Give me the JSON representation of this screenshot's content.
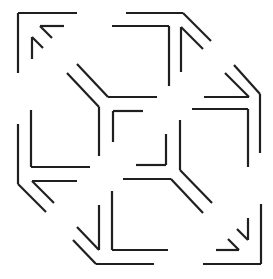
{
  "figure": {
    "title": "",
    "stroke_color": "#1f1f1f",
    "background_color": "#ffffff",
    "segments": [
      {
        "id": "tl-outer-h",
        "x1": 18,
        "y1": 13,
        "x2": 77,
        "y2": 13
      },
      {
        "id": "tl-outer-v",
        "x1": 18,
        "y1": 13,
        "x2": 18,
        "y2": 73
      },
      {
        "id": "tl-arrow-h",
        "x1": 40,
        "y1": 26,
        "x2": 64,
        "y2": 26
      },
      {
        "id": "tl-arrow-d1",
        "x1": 40,
        "y1": 26,
        "x2": 52,
        "y2": 38
      },
      {
        "id": "tl-arrow-v",
        "x1": 32,
        "y1": 37,
        "x2": 32,
        "y2": 59
      },
      {
        "id": "tl-arrow-d2",
        "x1": 32,
        "y1": 37,
        "x2": 43,
        "y2": 48
      },
      {
        "id": "tr-outer-h",
        "x1": 126,
        "y1": 13,
        "x2": 183,
        "y2": 13
      },
      {
        "id": "tr-outer-d",
        "x1": 183,
        "y1": 13,
        "x2": 211,
        "y2": 41
      },
      {
        "id": "tr-inner-h",
        "x1": 112,
        "y1": 26,
        "x2": 169,
        "y2": 26
      },
      {
        "id": "tr-inner-v",
        "x1": 169,
        "y1": 26,
        "x2": 169,
        "y2": 86
      },
      {
        "id": "tr-arrow-v",
        "x1": 181,
        "y1": 27,
        "x2": 181,
        "y2": 72
      },
      {
        "id": "tr-arrow-d",
        "x1": 181,
        "y1": 27,
        "x2": 203,
        "y2": 49
      },
      {
        "id": "r-outer-d",
        "x1": 234,
        "y1": 65,
        "x2": 260,
        "y2": 94
      },
      {
        "id": "r-outer-v",
        "x1": 260,
        "y1": 94,
        "x2": 260,
        "y2": 153
      },
      {
        "id": "r-arrow-d",
        "x1": 225,
        "y1": 73,
        "x2": 249,
        "y2": 97
      },
      {
        "id": "r-arrow-h",
        "x1": 204,
        "y1": 97,
        "x2": 249,
        "y2": 97
      },
      {
        "id": "r-inner-h",
        "x1": 192,
        "y1": 109,
        "x2": 248,
        "y2": 109
      },
      {
        "id": "r-inner-v",
        "x1": 248,
        "y1": 109,
        "x2": 248,
        "y2": 167
      },
      {
        "id": "c-tl-d1",
        "x1": 77,
        "y1": 64,
        "x2": 108,
        "y2": 97
      },
      {
        "id": "c-tl-h",
        "x1": 108,
        "y1": 97,
        "x2": 157,
        "y2": 97
      },
      {
        "id": "c-tl-d2",
        "x1": 67,
        "y1": 73,
        "x2": 99,
        "y2": 107
      },
      {
        "id": "c-tl-v",
        "x1": 99,
        "y1": 107,
        "x2": 99,
        "y2": 156
      },
      {
        "id": "c-sq-h",
        "x1": 113,
        "y1": 111,
        "x2": 143,
        "y2": 111
      },
      {
        "id": "c-sq-v",
        "x1": 113,
        "y1": 111,
        "x2": 113,
        "y2": 142
      },
      {
        "id": "c-sq2-v",
        "x1": 166,
        "y1": 134,
        "x2": 166,
        "y2": 165
      },
      {
        "id": "c-sq2-h",
        "x1": 136,
        "y1": 165,
        "x2": 166,
        "y2": 165
      },
      {
        "id": "c-br-v",
        "x1": 180,
        "y1": 120,
        "x2": 180,
        "y2": 170
      },
      {
        "id": "c-br-d1",
        "x1": 180,
        "y1": 170,
        "x2": 212,
        "y2": 203
      },
      {
        "id": "c-br-h",
        "x1": 123,
        "y1": 179,
        "x2": 171,
        "y2": 179
      },
      {
        "id": "c-br-d2",
        "x1": 171,
        "y1": 179,
        "x2": 203,
        "y2": 213
      },
      {
        "id": "l-inner-v",
        "x1": 31,
        "y1": 110,
        "x2": 31,
        "y2": 167
      },
      {
        "id": "l-inner-h",
        "x1": 31,
        "y1": 167,
        "x2": 90,
        "y2": 167
      },
      {
        "id": "l-outer-v",
        "x1": 18,
        "y1": 124,
        "x2": 18,
        "y2": 184
      },
      {
        "id": "l-outer-d",
        "x1": 18,
        "y1": 184,
        "x2": 46,
        "y2": 212
      },
      {
        "id": "l-arrow-h",
        "x1": 32,
        "y1": 181,
        "x2": 77,
        "y2": 181
      },
      {
        "id": "l-arrow-d",
        "x1": 32,
        "y1": 181,
        "x2": 54,
        "y2": 203
      },
      {
        "id": "bl-arrow-v",
        "x1": 99,
        "y1": 205,
        "x2": 99,
        "y2": 250
      },
      {
        "id": "bl-arrow-d",
        "x1": 77,
        "y1": 227,
        "x2": 99,
        "y2": 250
      },
      {
        "id": "bl-inner-v",
        "x1": 112,
        "y1": 191,
        "x2": 112,
        "y2": 250
      },
      {
        "id": "bl-inner-h",
        "x1": 112,
        "y1": 250,
        "x2": 168,
        "y2": 250
      },
      {
        "id": "bl-outer-d",
        "x1": 73,
        "y1": 240,
        "x2": 96,
        "y2": 264
      },
      {
        "id": "bl-outer-h",
        "x1": 96,
        "y1": 264,
        "x2": 154,
        "y2": 264
      },
      {
        "id": "br-outer-v",
        "x1": 261,
        "y1": 204,
        "x2": 261,
        "y2": 264
      },
      {
        "id": "br-outer-h",
        "x1": 203,
        "y1": 264,
        "x2": 261,
        "y2": 264
      },
      {
        "id": "br-arrow-v",
        "x1": 248,
        "y1": 218,
        "x2": 248,
        "y2": 240
      },
      {
        "id": "br-arrow-d1",
        "x1": 237,
        "y1": 229,
        "x2": 248,
        "y2": 240
      },
      {
        "id": "br-arrow-h",
        "x1": 216,
        "y1": 250,
        "x2": 239,
        "y2": 250
      },
      {
        "id": "br-arrow-d2",
        "x1": 228,
        "y1": 239,
        "x2": 239,
        "y2": 250
      }
    ]
  }
}
